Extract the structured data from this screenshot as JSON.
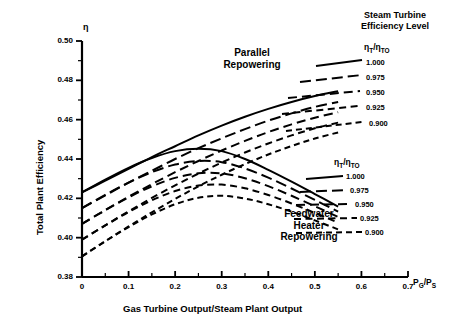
{
  "chart_data": {
    "type": "line",
    "title": "",
    "xlabel": "Gas Turbine Output/Steam Plant Output",
    "ylabel": "Total Plant Efficiency",
    "x_axis_symbol": "P_G/P_S",
    "y_axis_symbol": "η",
    "xlim": [
      0,
      0.7
    ],
    "ylim": [
      0.38,
      0.5
    ],
    "xticks": [
      0,
      0.1,
      0.2,
      0.3,
      0.4,
      0.5,
      0.6,
      0.7
    ],
    "xtick_labels": [
      "0",
      "0.1",
      "0.2",
      "0.3",
      "0.4",
      "0.5",
      "0.6",
      "0.7"
    ],
    "yticks": [
      0.38,
      0.4,
      0.42,
      0.44,
      0.46,
      0.48,
      0.5
    ],
    "ytick_labels": [
      "0.38",
      "0.40",
      "0.42",
      "0.44",
      "0.46",
      "0.48",
      "0.50"
    ],
    "x_minor_step": 0.05,
    "y_minor_step": 0.01,
    "grid": false,
    "legend_position": "right",
    "groups": [
      {
        "name": "Parallel Repowering",
        "annotation": "Parallel\nRepowering",
        "series": [
          {
            "name": "1.000",
            "style": "solid",
            "x": [
              0,
              0.05,
              0.1,
              0.15,
              0.2,
              0.25,
              0.3,
              0.35,
              0.4,
              0.45,
              0.5,
              0.55
            ],
            "y": [
              0.423,
              0.429,
              0.435,
              0.441,
              0.4465,
              0.452,
              0.457,
              0.4615,
              0.4655,
              0.469,
              0.472,
              0.4745
            ]
          },
          {
            "name": "0.975",
            "style": "dash-long",
            "x": [
              0,
              0.05,
              0.1,
              0.15,
              0.2,
              0.25,
              0.3,
              0.35,
              0.4,
              0.45,
              0.5,
              0.55
            ],
            "y": [
              0.415,
              0.4215,
              0.428,
              0.434,
              0.44,
              0.4455,
              0.4505,
              0.4552,
              0.4595,
              0.4632,
              0.4665,
              0.469
            ]
          },
          {
            "name": "0.950",
            "style": "dash-med",
            "x": [
              0,
              0.05,
              0.1,
              0.15,
              0.2,
              0.25,
              0.3,
              0.35,
              0.4,
              0.45,
              0.5,
              0.55
            ],
            "y": [
              0.407,
              0.414,
              0.4208,
              0.4272,
              0.4333,
              0.439,
              0.4443,
              0.4492,
              0.4537,
              0.4576,
              0.461,
              0.4638
            ]
          },
          {
            "name": "0.925",
            "style": "dash-short",
            "x": [
              0,
              0.05,
              0.1,
              0.15,
              0.2,
              0.25,
              0.3,
              0.35,
              0.4,
              0.45,
              0.5,
              0.55
            ],
            "y": [
              0.399,
              0.4063,
              0.4134,
              0.4202,
              0.4266,
              0.4326,
              0.4382,
              0.4433,
              0.4479,
              0.452,
              0.4556,
              0.4585
            ]
          },
          {
            "name": "0.900",
            "style": "dash-xshort",
            "x": [
              0,
              0.05,
              0.1,
              0.15,
              0.2,
              0.25,
              0.3,
              0.35,
              0.4,
              0.45,
              0.5,
              0.55
            ],
            "y": [
              0.3905,
              0.3982,
              0.4057,
              0.4129,
              0.4197,
              0.4261,
              0.432,
              0.4374,
              0.4423,
              0.4466,
              0.4504,
              0.4535
            ]
          }
        ]
      },
      {
        "name": "Feedwater Heater Repowering",
        "annotation": "Feedwater\nHeater\nRepowering",
        "series": [
          {
            "name": "1.000",
            "style": "solid",
            "x": [
              0,
              0.05,
              0.1,
              0.15,
              0.2,
              0.25,
              0.3,
              0.35,
              0.4,
              0.45,
              0.5,
              0.55
            ],
            "y": [
              0.423,
              0.4295,
              0.4355,
              0.4405,
              0.444,
              0.4452,
              0.444,
              0.44,
              0.4345,
              0.4285,
              0.4222,
              0.4158
            ]
          },
          {
            "name": "0.975",
            "style": "dash-long",
            "x": [
              0,
              0.05,
              0.1,
              0.15,
              0.2,
              0.25,
              0.3,
              0.35,
              0.4,
              0.45,
              0.5,
              0.55
            ],
            "y": [
              0.415,
              0.4218,
              0.428,
              0.4333,
              0.4372,
              0.439,
              0.4384,
              0.4352,
              0.4305,
              0.425,
              0.4192,
              0.4132
            ]
          },
          {
            "name": "0.950",
            "style": "dash-med",
            "x": [
              0,
              0.05,
              0.1,
              0.15,
              0.2,
              0.25,
              0.3,
              0.35,
              0.4,
              0.45,
              0.5,
              0.55
            ],
            "y": [
              0.407,
              0.414,
              0.4205,
              0.4261,
              0.4304,
              0.4327,
              0.4327,
              0.4302,
              0.4262,
              0.4213,
              0.416,
              0.4105
            ]
          },
          {
            "name": "0.925",
            "style": "dash-short",
            "x": [
              0,
              0.05,
              0.1,
              0.15,
              0.2,
              0.25,
              0.3,
              0.35,
              0.4,
              0.45,
              0.5,
              0.55
            ],
            "y": [
              0.399,
              0.4062,
              0.413,
              0.419,
              0.4237,
              0.4265,
              0.427,
              0.4251,
              0.4217,
              0.4174,
              0.4126,
              0.4076
            ]
          },
          {
            "name": "0.900",
            "style": "dash-xshort",
            "x": [
              0,
              0.05,
              0.1,
              0.15,
              0.2,
              0.25,
              0.3,
              0.35,
              0.4,
              0.45,
              0.5,
              0.55
            ],
            "y": [
              0.3905,
              0.3982,
              0.4054,
              0.4118,
              0.417,
              0.4203,
              0.4213,
              0.4199,
              0.417,
              0.4132,
              0.4088,
              0.4042
            ]
          }
        ]
      }
    ]
  },
  "legends": {
    "upper": {
      "title_line1": "Steam Turbine",
      "title_line2": "Efficiency Level",
      "ratio_main": "η",
      "ratio_sub1": "T",
      "ratio_slash": "/",
      "ratio_main2": "η",
      "ratio_sub2": "TO",
      "values": [
        "1.000",
        "0.975",
        "0.950",
        "0.925",
        "0.900"
      ]
    },
    "lower": {
      "ratio_main": "η",
      "ratio_sub1": "T",
      "ratio_slash": "/",
      "ratio_main2": "η",
      "ratio_sub2": "TO",
      "values": [
        "1.000",
        "0.975",
        "0.950",
        "0.925",
        "0.900"
      ]
    }
  },
  "annotations": {
    "parallel_line1": "Parallel",
    "parallel_line2": "Repowering",
    "feedwater_line1": "Feedwater",
    "feedwater_line2": "Heater",
    "feedwater_line3": "Repowering"
  },
  "axis_text": {
    "eta": "η",
    "x_title": "Gas Turbine Output/Steam Plant Output",
    "y_title": "Total Plant Efficiency",
    "x_sym_p": "P",
    "x_sym_g": "G",
    "x_sym_slash": "/P",
    "x_sym_s": "S"
  },
  "colors": {
    "line": "#000000",
    "axis": "#000000",
    "background": "#ffffff"
  }
}
